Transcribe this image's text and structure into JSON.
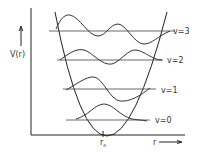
{
  "diagram": {
    "y_axis_label": "V(r)",
    "x_axis_label": "r",
    "equilibrium_label": "r",
    "equilibrium_subscript": "e",
    "levels": [
      {
        "label": "v=0",
        "quantum_number": 0
      },
      {
        "label": "v=1",
        "quantum_number": 1
      },
      {
        "label": "v=2",
        "quantum_number": 2
      },
      {
        "label": "v=3",
        "quantum_number": 3
      }
    ],
    "colors": {
      "line": "#222222",
      "background": "#ffffff"
    }
  }
}
